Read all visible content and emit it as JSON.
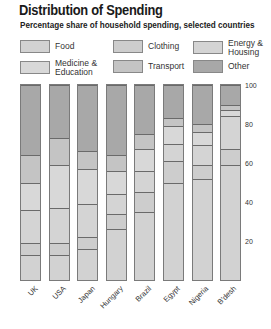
{
  "chart_data": {
    "type": "bar",
    "stacked": true,
    "title": "Distribution of Spending",
    "subtitle": "Percentage share of household spending, selected countries",
    "xlabel": "",
    "ylabel": "",
    "ylim": [
      0,
      100
    ],
    "yticks": [
      20,
      40,
      60,
      80,
      100
    ],
    "grid": false,
    "legend_position": "top",
    "categories": [
      "UK",
      "USA",
      "Japan",
      "Hungary",
      "Brazil",
      "Egypt",
      "Nigeria",
      "B'desh"
    ],
    "series": [
      {
        "name": "Food",
        "color": "#d2d2d2",
        "values": [
          13,
          13,
          16,
          26,
          35,
          50,
          52,
          59
        ]
      },
      {
        "name": "Clothing",
        "color": "#cdcdcd",
        "values": [
          6,
          6,
          6,
          8,
          10,
          11,
          7,
          8
        ]
      },
      {
        "name": "Energy & Housing",
        "color": "#d4d4d4",
        "values": [
          17,
          18,
          17,
          10,
          11,
          9,
          10,
          17
        ]
      },
      {
        "name": "Medicine & Education",
        "color": "#d8d8d8",
        "values": [
          14,
          22,
          18,
          12,
          11,
          9,
          7,
          3
        ]
      },
      {
        "name": "Transport",
        "color": "#c4c4c4",
        "values": [
          14,
          14,
          9,
          8,
          8,
          4,
          4,
          3
        ]
      },
      {
        "name": "Other",
        "color": "#a8a8a8",
        "values": [
          36,
          27,
          34,
          36,
          25,
          17,
          20,
          10
        ]
      }
    ]
  },
  "legend": [
    {
      "label": "Food",
      "color": "#d2d2d2"
    },
    {
      "label": "Clothing",
      "color": "#cdcdcd"
    },
    {
      "label": "Energy &\nHousing",
      "color": "#d4d4d4"
    },
    {
      "label": "Medicine &\nEducation",
      "color": "#d8d8d8"
    },
    {
      "label": "Transport",
      "color": "#c4c4c4"
    },
    {
      "label": "Other",
      "color": "#a8a8a8"
    }
  ],
  "yticks": [
    "100",
    "80",
    "60",
    "40",
    "20"
  ],
  "categories": [
    "UK",
    "USA",
    "Japan",
    "Hungary",
    "Brazil",
    "Egypt",
    "Nigeria",
    "B'desh"
  ]
}
